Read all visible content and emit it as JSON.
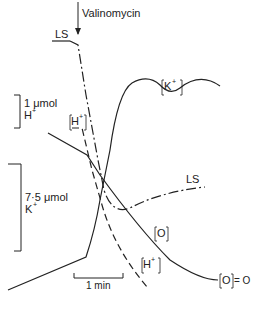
{
  "figure": {
    "type": "time-course traces",
    "annotations": {
      "valinomycin": "Valinomycin",
      "ls_top": "LS",
      "ls_right": "LS",
      "k_plus": "K",
      "k_sup": "+",
      "h_plus_top": "H",
      "h_sup_top": "+",
      "h_plus_bottom": "H",
      "h_sup_bottom": "+",
      "o_trace": "O",
      "o_zero": "O",
      "o_zero_eq": "= O"
    },
    "scale_bars": {
      "h_scale_value": "1 μmol",
      "h_scale_unit": "H",
      "h_scale_sup": "+",
      "k_scale_value": "7·5 μmol",
      "k_scale_unit": "K",
      "k_scale_sup": "+",
      "time_scale": "1 min"
    },
    "traces": [
      {
        "name": "[K+]",
        "style": "solid"
      },
      {
        "name": "[H+]",
        "style": "dashed"
      },
      {
        "name": "LS",
        "style": "dash-dot"
      },
      {
        "name": "[O]",
        "style": "solid"
      }
    ],
    "colors": {
      "ink": "#222222",
      "background": "#ffffff"
    }
  }
}
